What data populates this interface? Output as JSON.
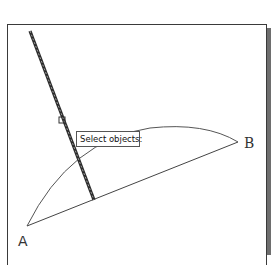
{
  "canvas": {
    "background": "#ffffff",
    "frame_border_color": "#3a3a3a",
    "frame_shadow_color": "#6e6e6e"
  },
  "points": {
    "a": {
      "label": "A",
      "x": 27,
      "y": 226
    },
    "b": {
      "label": "B",
      "x": 238,
      "y": 142
    }
  },
  "entities": {
    "arc": {
      "start": "A",
      "end": "B",
      "color": "#444444"
    },
    "chord": {
      "start": "A",
      "end": "B",
      "color": "#444444"
    },
    "selected_line": {
      "x1": 30,
      "y1": 31,
      "x2": 94,
      "y2": 200,
      "style": "highlighted-dashed"
    }
  },
  "cursor": {
    "type": "pickbox",
    "x": 62,
    "y": 120
  },
  "tooltip": {
    "text": "Select objects:"
  }
}
